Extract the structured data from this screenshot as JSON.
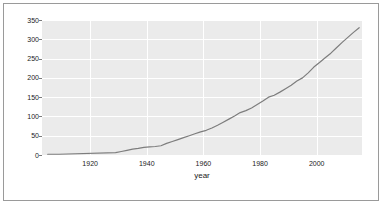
{
  "chart_data": {
    "type": "line",
    "title": "",
    "subtitle": "",
    "xlabel": "year",
    "ylabel": "",
    "grid": true,
    "legend": "none",
    "xlim": [
      1903,
      2016
    ],
    "ylim": [
      0,
      350
    ],
    "xticks": [
      1920,
      1940,
      1960,
      1980,
      2000
    ],
    "yticks": [
      0,
      50,
      100,
      150,
      200,
      250,
      300,
      350
    ],
    "series": [
      {
        "name": "value",
        "color": "#7d7d7d",
        "x": [
          1905,
          1907,
          1909,
          1929,
          1931,
          1933,
          1935,
          1937,
          1939,
          1941,
          1943,
          1945,
          1947,
          1949,
          1951,
          1953,
          1955,
          1957,
          1959,
          1961,
          1963,
          1965,
          1967,
          1969,
          1971,
          1973,
          1975,
          1977,
          1979,
          1981,
          1983,
          1985,
          1987,
          1989,
          1991,
          1993,
          1995,
          1997,
          1999,
          2001,
          2003,
          2005,
          2007,
          2009,
          2011,
          2013,
          2015
        ],
        "y": [
          2,
          2,
          2,
          6,
          9,
          12,
          15,
          17,
          20,
          21,
          22,
          24,
          30,
          35,
          40,
          45,
          50,
          55,
          60,
          64,
          70,
          77,
          85,
          93,
          101,
          110,
          115,
          122,
          131,
          140,
          150,
          155,
          163,
          172,
          181,
          192,
          200,
          213,
          228,
          240,
          252,
          264,
          278,
          292,
          305,
          318,
          330
        ]
      }
    ]
  },
  "axes": {
    "y_tick_labels": [
      "350",
      "300",
      "250",
      "200",
      "150",
      "100",
      "50",
      "0"
    ],
    "x_tick_labels": [
      "1920",
      "1940",
      "1960",
      "1980",
      "2000"
    ],
    "x_axis_title": "year"
  },
  "style": {
    "plot_background": "#ebebeb",
    "gridline_color": "#ffffff",
    "line_color": "#7d7d7d",
    "frame_color": "#9a9a9a",
    "text_color": "#1a1a1a",
    "page_background": "#ffffff"
  }
}
